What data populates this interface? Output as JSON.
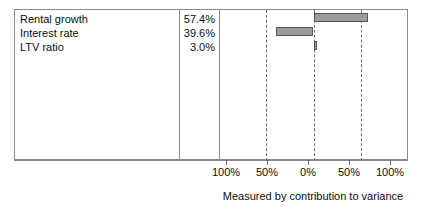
{
  "chart_data": {
    "type": "bar",
    "chart_subtype": "tornado-sensitivity",
    "title": "",
    "xlabel": "Measured by contribution to variance",
    "ylabel": "",
    "categories": [
      "Rental growth",
      "Interest rate",
      "LTV ratio"
    ],
    "values": [
      57.4,
      39.6,
      3.0
    ],
    "value_labels": [
      "57.4%",
      "39.6%",
      "3.0%"
    ],
    "directions": [
      "right",
      "left",
      "right"
    ],
    "axis": {
      "tick_labels": [
        "100%",
        "50%",
        "0%",
        "50%",
        "100%"
      ],
      "tick_values": [
        -100,
        -50,
        0,
        50,
        100
      ],
      "xlim": [
        -100,
        100
      ],
      "zero_at": "0%",
      "grid": true,
      "gridline_style": "dashed",
      "gridline_at": [
        -50,
        0,
        50
      ],
      "solid_tick_at": [
        -100,
        100
      ]
    },
    "legend": null,
    "colors": {
      "bar_fill": "#9c9c9c",
      "bar_border": "#545454",
      "frame": "#8a8a8a",
      "gridline": "#6f6f6f",
      "text": "#0d0d0d",
      "background": "#ffffff"
    }
  },
  "table": {
    "rows": [
      {
        "label": "Rental growth",
        "value": "57.4%"
      },
      {
        "label": "Interest rate",
        "value": "39.6%"
      },
      {
        "label": "LTV ratio",
        "value": "3.0%"
      }
    ]
  },
  "axis_labels": {
    "t0": "100%",
    "t1": "50%",
    "t2": "0%",
    "t3": "50%",
    "t4": "100%"
  },
  "caption": {
    "text": "Measured by contribution to variance"
  }
}
